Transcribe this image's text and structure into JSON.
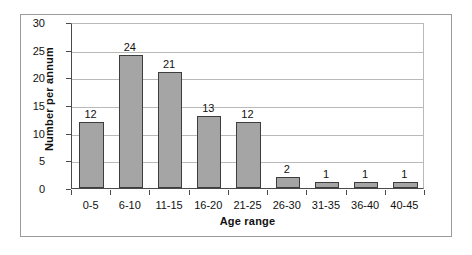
{
  "chart_data": {
    "type": "bar",
    "title": "",
    "xlabel": "Age range",
    "ylabel": "Number  per annum",
    "categories": [
      "0-5",
      "6-10",
      "11-15",
      "16-20",
      "21-25",
      "26-30",
      "31-35",
      "36-40",
      "40-45"
    ],
    "values": [
      12,
      24,
      21,
      13,
      12,
      2,
      1,
      1,
      1
    ],
    "value_labels": [
      "12",
      "24",
      "21",
      "13",
      "12",
      "2",
      "1",
      "1",
      "1"
    ],
    "ylim": [
      0,
      30
    ],
    "ytick_labels": [
      "30",
      "25",
      "20",
      "15",
      "10",
      "5",
      "0"
    ],
    "ytick_values": [
      30,
      25,
      20,
      15,
      10,
      5,
      0
    ],
    "grid": true,
    "legend": "none",
    "bar_color": "#a5a5a5",
    "bar_border_color": "#3d3d3d",
    "gridline_color": "#b9b9b9",
    "axis_color": "#4a4a4a",
    "frame_color": "#9b9b9b",
    "background": "#ffffff",
    "show_value_labels": true
  }
}
